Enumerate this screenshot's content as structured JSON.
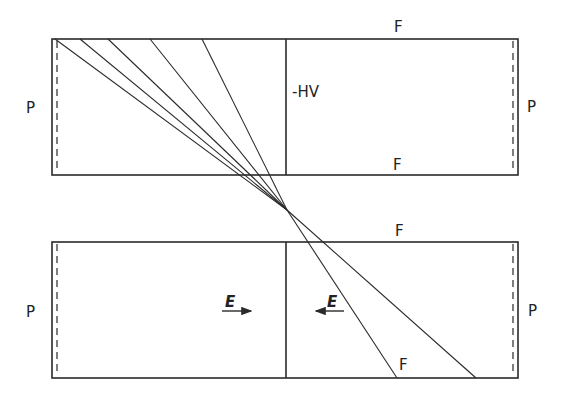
{
  "diagram": {
    "type": "electrode-chamber-schematic",
    "stroke_color": "#2a2a2a",
    "background": "#ffffff",
    "top_chamber": {
      "rect": {
        "x1": 52,
        "y1": 39,
        "x2": 518,
        "y2": 175
      },
      "divider_x": 286,
      "dashed_left_x": 57,
      "dashed_right_x": 513,
      "labels": {
        "left": "P",
        "right": "P",
        "top": "F",
        "bottom": "F",
        "divider": "-HV"
      }
    },
    "bottom_chamber": {
      "rect": {
        "x1": 52,
        "y1": 242,
        "x2": 518,
        "y2": 378
      },
      "divider_x": 286,
      "dashed_left_x": 57,
      "dashed_right_x": 513,
      "labels": {
        "left": "P",
        "right": "P",
        "top": "F",
        "inner_f": "F",
        "field_left": "E",
        "field_right": "E"
      }
    },
    "focus_point": {
      "x": 287,
      "y": 210
    },
    "rays_converging": [
      {
        "x1": 55,
        "y1": 39
      },
      {
        "x1": 80,
        "y1": 39
      },
      {
        "x1": 108,
        "y1": 39
      },
      {
        "x1": 150,
        "y1": 39
      },
      {
        "x1": 202,
        "y1": 39
      }
    ],
    "rays_diverging": [
      {
        "x2": 397,
        "y2": 378
      },
      {
        "x2": 476,
        "y2": 378
      }
    ],
    "ray_pairs": [
      {
        "from": [
          55,
          39
        ],
        "to": [
          476,
          378
        ]
      },
      {
        "from": [
          80,
          39
        ],
        "to": [
          476,
          378
        ]
      },
      {
        "from": [
          202,
          39
        ],
        "to": [
          397,
          378
        ]
      }
    ]
  }
}
